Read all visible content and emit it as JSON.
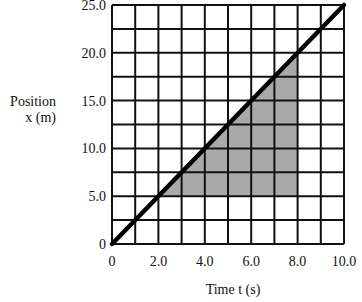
{
  "chart_data": {
    "type": "line",
    "title": "",
    "xlabel": "Time t (s)",
    "ylabel_lines": [
      "Position",
      "x (m)"
    ],
    "xlim": [
      0,
      10
    ],
    "ylim": [
      0,
      25
    ],
    "grid": true,
    "grid_x_step": 1.0,
    "grid_y_step": 2.5,
    "x_ticks": [
      {
        "value": 0,
        "label": "0"
      },
      {
        "value": 2,
        "label": "2.0"
      },
      {
        "value": 4,
        "label": "4.0"
      },
      {
        "value": 6,
        "label": "6.0"
      },
      {
        "value": 8,
        "label": "8.0"
      },
      {
        "value": 10,
        "label": "10.0"
      }
    ],
    "y_ticks": [
      {
        "value": 0,
        "label": "0"
      },
      {
        "value": 5,
        "label": "5.0"
      },
      {
        "value": 10,
        "label": "10.0"
      },
      {
        "value": 15,
        "label": "15.0"
      },
      {
        "value": 20,
        "label": "20.0"
      },
      {
        "value": 25,
        "label": "25.0"
      }
    ],
    "series": [
      {
        "name": "position",
        "x": [
          0,
          10
        ],
        "y": [
          0,
          25
        ],
        "color": "#000000"
      }
    ],
    "shaded_region": {
      "description": "area between line and x=5.0 from t=3.0 to t=8.0",
      "vertices": [
        [
          2,
          5
        ],
        [
          8,
          5
        ],
        [
          8,
          20
        ]
      ],
      "color": "#a9a9a9"
    },
    "legend": null
  },
  "labels": {
    "ylabel_line1": "Position",
    "ylabel_line2": "x (m)",
    "xlabel": "Time t (s)"
  }
}
